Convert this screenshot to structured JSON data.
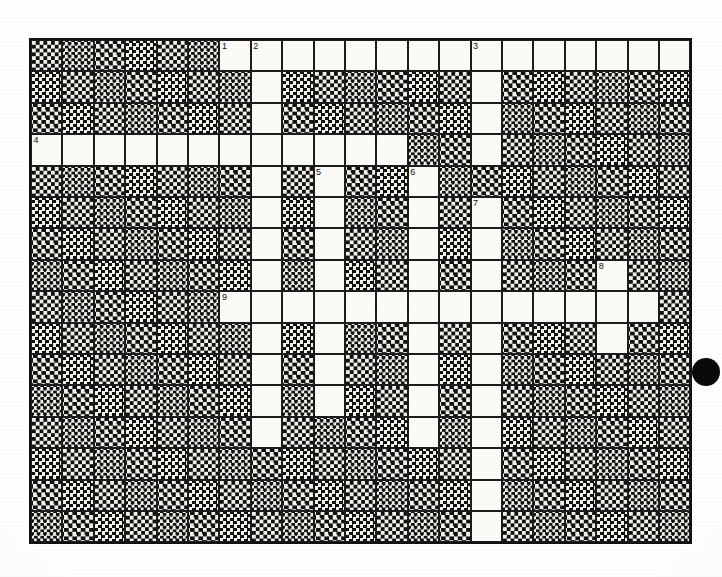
{
  "page": {
    "kind": "crossword-puzzle-scan",
    "background_color": "#ffffff",
    "paper_color": "#fbfaf6",
    "ink_color": "#111111"
  },
  "grid": {
    "columns": 21,
    "rows": 16,
    "cell_size": 31.4,
    "origin_x": 29,
    "origin_y": 38,
    "border_color": "#1a1a1a",
    "open_cell_color": "#fcfbf7",
    "block_cell_color": "#111111",
    "block_style": "checkerboard-halftone",
    "open_cells": [
      [
        0,
        6
      ],
      [
        0,
        7
      ],
      [
        0,
        8
      ],
      [
        0,
        9
      ],
      [
        0,
        10
      ],
      [
        0,
        11
      ],
      [
        0,
        12
      ],
      [
        0,
        13
      ],
      [
        0,
        14
      ],
      [
        0,
        15
      ],
      [
        0,
        16
      ],
      [
        0,
        17
      ],
      [
        0,
        18
      ],
      [
        0,
        19
      ],
      [
        0,
        20
      ],
      [
        1,
        7
      ],
      [
        1,
        14
      ],
      [
        2,
        7
      ],
      [
        2,
        14
      ],
      [
        3,
        0
      ],
      [
        3,
        1
      ],
      [
        3,
        2
      ],
      [
        3,
        3
      ],
      [
        3,
        4
      ],
      [
        3,
        5
      ],
      [
        3,
        6
      ],
      [
        3,
        7
      ],
      [
        3,
        8
      ],
      [
        3,
        9
      ],
      [
        3,
        10
      ],
      [
        3,
        11
      ],
      [
        3,
        14
      ],
      [
        4,
        7
      ],
      [
        4,
        9
      ],
      [
        4,
        12
      ],
      [
        5,
        7
      ],
      [
        5,
        9
      ],
      [
        5,
        12
      ],
      [
        5,
        14
      ],
      [
        6,
        7
      ],
      [
        6,
        9
      ],
      [
        6,
        12
      ],
      [
        6,
        14
      ],
      [
        7,
        7
      ],
      [
        7,
        9
      ],
      [
        7,
        12
      ],
      [
        7,
        14
      ],
      [
        7,
        18
      ],
      [
        8,
        6
      ],
      [
        8,
        7
      ],
      [
        8,
        8
      ],
      [
        8,
        9
      ],
      [
        8,
        10
      ],
      [
        8,
        11
      ],
      [
        8,
        12
      ],
      [
        8,
        13
      ],
      [
        8,
        14
      ],
      [
        8,
        15
      ],
      [
        8,
        16
      ],
      [
        8,
        17
      ],
      [
        8,
        18
      ],
      [
        8,
        19
      ],
      [
        9,
        7
      ],
      [
        9,
        9
      ],
      [
        9,
        12
      ],
      [
        9,
        14
      ],
      [
        9,
        18
      ],
      [
        10,
        7
      ],
      [
        10,
        9
      ],
      [
        10,
        12
      ],
      [
        10,
        14
      ],
      [
        11,
        7
      ],
      [
        11,
        9
      ],
      [
        11,
        12
      ],
      [
        11,
        14
      ],
      [
        12,
        7
      ],
      [
        12,
        12
      ],
      [
        12,
        14
      ],
      [
        13,
        14
      ],
      [
        14,
        14
      ],
      [
        15,
        14
      ]
    ],
    "clue_numbers": [
      {
        "number": "1",
        "row": 0,
        "col": 6
      },
      {
        "number": "2",
        "row": 0,
        "col": 7
      },
      {
        "number": "3",
        "row": 0,
        "col": 14
      },
      {
        "number": "4",
        "row": 3,
        "col": 0
      },
      {
        "number": "5",
        "row": 4,
        "col": 9
      },
      {
        "number": "6",
        "row": 4,
        "col": 12
      },
      {
        "number": "7",
        "row": 5,
        "col": 14
      },
      {
        "number": "8",
        "row": 7,
        "col": 18
      },
      {
        "number": "9",
        "row": 8,
        "col": 6
      }
    ]
  },
  "margin_dot": {
    "x": 692,
    "y": 358,
    "size": 28,
    "color": "#0a0a0a"
  }
}
